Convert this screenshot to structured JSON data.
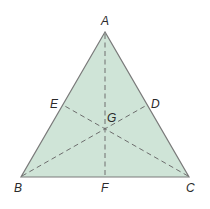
{
  "diagram": {
    "type": "triangle-with-medians",
    "colors": {
      "fill": "#cfe4d7",
      "edge": "#7a7a7a",
      "median": "#6e6e6e",
      "label": "#2a2a2a"
    },
    "vertices": {
      "A": {
        "label": "A",
        "x": 105,
        "y": 32
      },
      "B": {
        "label": "B",
        "x": 21,
        "y": 177
      },
      "C": {
        "label": "C",
        "x": 189,
        "y": 177
      }
    },
    "midpoints": {
      "D": {
        "label": "D",
        "x": 147,
        "y": 105
      },
      "E": {
        "label": "E",
        "x": 63,
        "y": 105
      },
      "F": {
        "label": "F",
        "x": 105,
        "y": 177
      }
    },
    "centroid": {
      "label": "G",
      "x": 105,
      "y": 129
    },
    "medians": [
      {
        "from": "A",
        "to": "F"
      },
      {
        "from": "B",
        "to": "D"
      },
      {
        "from": "C",
        "to": "E"
      }
    ]
  }
}
